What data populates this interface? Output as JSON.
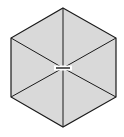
{
  "diagram": {
    "shape": "regular-hexagon",
    "fill": "#d9d9d9",
    "stroke": "#1a1a1a",
    "background": "#ffffff",
    "center": [
      63,
      68
    ],
    "vertices": [
      [
        63,
        8
      ],
      [
        116,
        38
      ],
      [
        116,
        97
      ],
      [
        63,
        127
      ],
      [
        11,
        97
      ],
      [
        11,
        38
      ]
    ],
    "center_gap": {
      "x1": 56,
      "x2": 70,
      "y": 68
    }
  }
}
